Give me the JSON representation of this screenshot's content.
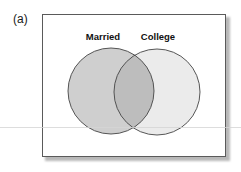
{
  "figure": {
    "panel_label": "(a)",
    "sets": [
      {
        "name": "Married",
        "label": "Married",
        "fill": "#cfcfcf",
        "cx": 111,
        "cy": 91,
        "r": 43
      },
      {
        "name": "College",
        "label": "College",
        "fill": "#ebebeb",
        "cx": 157,
        "cy": 92,
        "r": 43
      }
    ],
    "intersection_fill": "#bdbdbd",
    "stroke_color": "#444444",
    "frame_border_color": "#5a5a5a"
  }
}
